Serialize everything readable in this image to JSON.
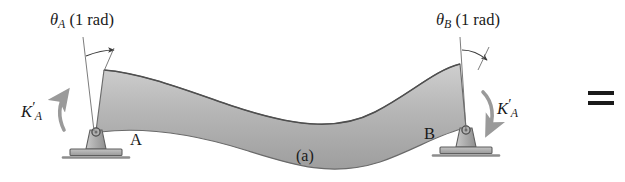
{
  "figure": {
    "caption": "(a)",
    "equals_symbol": "=",
    "background_color": "#ffffff",
    "ink_color": "#1a1a1a"
  },
  "labels": {
    "theta_a": {
      "symbol": "θ",
      "subscript": "A",
      "value": "(1 rad)"
    },
    "theta_b": {
      "symbol": "θ",
      "subscript": "B",
      "value": "(1 rad)"
    },
    "stiffness_left": {
      "symbol": "K",
      "prime": "′",
      "subscript": "A"
    },
    "stiffness_right": {
      "symbol": "K",
      "prime": "′",
      "subscript": "A"
    },
    "point_a": "A",
    "point_b": "B"
  },
  "beam": {
    "fill_color": "#b4b4b4",
    "edge_color": "#5a5a5a",
    "shape": "s-curve-deflected",
    "left_end_x": 96,
    "right_end_x": 466,
    "span_label": "A to B"
  },
  "supports": {
    "left": {
      "type": "pin-support",
      "at": "A",
      "ground_color": "#8c8c8c"
    },
    "right": {
      "type": "pin-support",
      "at": "B",
      "ground_color": "#8c8c8c"
    }
  },
  "moment_arrows": {
    "left": {
      "direction": "counterclockwise",
      "color": "#9a9a9a"
    },
    "right": {
      "direction": "clockwise",
      "color": "#9a9a9a"
    }
  },
  "angle_markers": {
    "left": {
      "reference": "vertical-line",
      "arc": "rotation-arc"
    },
    "right": {
      "reference": "vertical-line",
      "arc": "rotation-arc"
    }
  }
}
